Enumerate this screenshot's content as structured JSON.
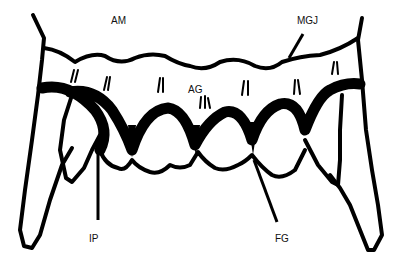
{
  "figure": {
    "type": "gingival anatomy schematic",
    "labels": {
      "am": "AM",
      "mgj": "MGJ",
      "ag": "AG",
      "ip": "IP",
      "fg": "FG"
    },
    "colors": {
      "ink": "#000000",
      "background": "#ffffff"
    }
  }
}
